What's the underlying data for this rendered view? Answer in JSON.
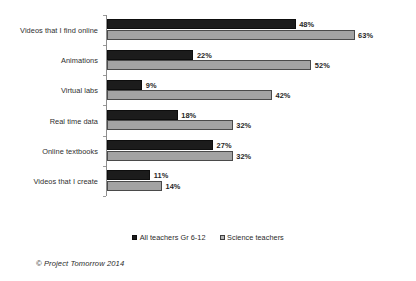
{
  "chart_data": {
    "type": "bar",
    "orientation": "horizontal",
    "title": "",
    "subtitle": "",
    "xlabel": "",
    "ylabel": "",
    "xlim": [
      0,
      70
    ],
    "grid": false,
    "legend_position": "bottom-center",
    "value_suffix": "%",
    "categories": [
      "Videos that I find online",
      "Animations",
      "Virtual labs",
      "Real time data",
      "Online textbooks",
      "Videos that I create"
    ],
    "series": [
      {
        "name": "All teachers Gr 6-12",
        "color": "#1c1c1c",
        "values": [
          48,
          22,
          9,
          18,
          27,
          11
        ],
        "labels": [
          "48%",
          "22%",
          "9%",
          "18%",
          "27%",
          "11%"
        ]
      },
      {
        "name": "Science teachers",
        "color": "#a3a3a3",
        "values": [
          63,
          52,
          42,
          32,
          32,
          14
        ],
        "labels": [
          "63%",
          "52%",
          "42%",
          "32%",
          "32%",
          "14%"
        ]
      }
    ],
    "annotations": [
      "© Project Tomorrow 2014"
    ]
  },
  "legend": {
    "entries": [
      {
        "label": "All teachers Gr 6-12",
        "marker": "filled-square-dark"
      },
      {
        "label": "Science teachers",
        "marker": "patterned-square-gray"
      }
    ]
  },
  "credit": {
    "text": "© Project Tomorrow 2014"
  },
  "scale": {
    "px_per_percent": 3.93
  }
}
